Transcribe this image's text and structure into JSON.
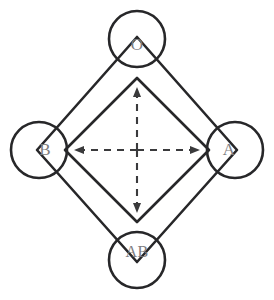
{
  "diagram": {
    "type": "node-link-diagram",
    "background_color": "#ffffff",
    "line_color": "#272729",
    "label_color": "#7d7d80",
    "arrow_color": "#3a3a3c",
    "center": {
      "x": 137,
      "y": 150
    },
    "nodes": [
      {
        "id": "O",
        "label": "O",
        "position": "top",
        "cx": 137,
        "cy": 45,
        "circle_cx": 137,
        "circle_cy": 39,
        "circle_r": 28
      },
      {
        "id": "B",
        "label": "B",
        "position": "left",
        "cx": 45,
        "cy": 150,
        "circle_cx": 39,
        "circle_cy": 150,
        "circle_r": 28
      },
      {
        "id": "A",
        "label": "A",
        "position": "right",
        "cx": 229,
        "cy": 150,
        "circle_cx": 235,
        "circle_cy": 150,
        "circle_r": 28
      },
      {
        "id": "AB",
        "label": "AB",
        "position": "bottom",
        "cx": 137,
        "cy": 253,
        "circle_cx": 137,
        "circle_cy": 260,
        "circle_r": 28
      }
    ],
    "outer_diamond": {
      "points": "137,37 237,150 137,262 37,150",
      "description": "large rotated square connecting the four node vertices"
    },
    "inner_diamond": {
      "points": "137,78 209,150 137,222 65,150",
      "description": "smaller rotated square concentric with the outer diamond"
    },
    "arrows": {
      "style": "dashed double-headed cross",
      "up": {
        "from_x": 137,
        "from_y": 150,
        "to_x": 137,
        "to_y": 88
      },
      "down": {
        "from_x": 137,
        "from_y": 150,
        "to_x": 137,
        "to_y": 212
      },
      "left": {
        "from_x": 137,
        "from_y": 150,
        "to_x": 75,
        "to_y": 150
      },
      "right": {
        "from_x": 137,
        "from_y": 150,
        "to_x": 199,
        "to_y": 150
      }
    }
  }
}
